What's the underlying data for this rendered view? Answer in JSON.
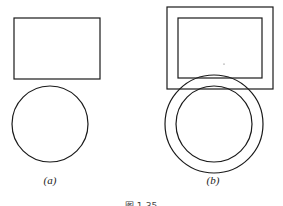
{
  "figure": {
    "caption": "图 1-35",
    "stroke_color": "#1a1a1a",
    "panels": [
      {
        "id": "a",
        "label": "(a)",
        "shapes": [
          {
            "type": "rect",
            "x": 14,
            "y": 18,
            "w": 86,
            "h": 61
          },
          {
            "type": "circle",
            "cx": 50,
            "cy": 124,
            "r": 38
          }
        ]
      },
      {
        "id": "b",
        "label": "(b)",
        "shapes": [
          {
            "type": "rect",
            "x": 167,
            "y": 7,
            "w": 106,
            "h": 82,
            "role": "outer-offset"
          },
          {
            "type": "rect",
            "x": 178,
            "y": 18,
            "w": 84,
            "h": 60,
            "role": "inner"
          },
          {
            "type": "circle",
            "cx": 214,
            "cy": 124,
            "r": 49,
            "role": "outer-offset"
          },
          {
            "type": "circle",
            "cx": 214,
            "cy": 124,
            "r": 38,
            "role": "inner"
          }
        ]
      }
    ]
  }
}
